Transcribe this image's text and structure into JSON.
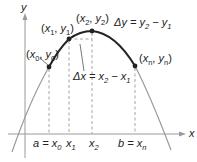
{
  "axes": {
    "x_label": "x",
    "y_label": "y"
  },
  "points": [
    {
      "id": "p0",
      "label_x": "x",
      "label_x_sub": "0",
      "label_y": "y",
      "label_y_sub": "0"
    },
    {
      "id": "p1",
      "label_x": "x",
      "label_x_sub": "1",
      "label_y": "y",
      "label_y_sub": "1"
    },
    {
      "id": "p2",
      "label_x": "x",
      "label_x_sub": "2",
      "label_y": "y",
      "label_y_sub": "2"
    },
    {
      "id": "pn",
      "label_x": "x",
      "label_x_sub": "n",
      "label_y": "y",
      "label_y_sub": "n"
    }
  ],
  "annotations": {
    "delta_y": {
      "lhs": "Δy = y",
      "sub1": "2",
      "mid": " − y",
      "sub2": "1"
    },
    "delta_x": {
      "lhs": "Δx = x",
      "sub1": "2",
      "mid": " − x",
      "sub2": "1"
    }
  },
  "ticks": {
    "a": {
      "prefix": "a = x",
      "sub": "0"
    },
    "x1": {
      "prefix": "x",
      "sub": "1"
    },
    "x2": {
      "prefix": "x",
      "sub": "2"
    },
    "b": {
      "prefix": "b = x",
      "sub": "n"
    }
  },
  "colors": {
    "curve_highlight": "#222222",
    "curve_faint": "#9a9a9a",
    "axis": "#9a9a9a",
    "dashed": "#9a9a9a",
    "point": "#222222"
  }
}
